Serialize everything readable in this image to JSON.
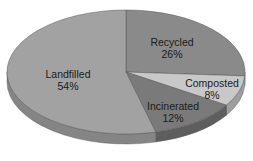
{
  "chart_data": {
    "type": "pie",
    "title": "",
    "slices": [
      {
        "label": "Recycled",
        "value": 26,
        "display": "26%",
        "color": "#8a8a8a",
        "side": "#6e6e6e"
      },
      {
        "label": "Composted",
        "value": 8,
        "display": "8%",
        "color": "#c8c8c8",
        "side": "#9e9e9e"
      },
      {
        "label": "Incinerated",
        "value": 12,
        "display": "12%",
        "color": "#7a7a7a",
        "side": "#5e5e5e"
      },
      {
        "label": "Landfilled",
        "value": 54,
        "display": "54%",
        "color": "#a2a2a2",
        "side": "#858585"
      }
    ],
    "style": "3d-tilted"
  }
}
